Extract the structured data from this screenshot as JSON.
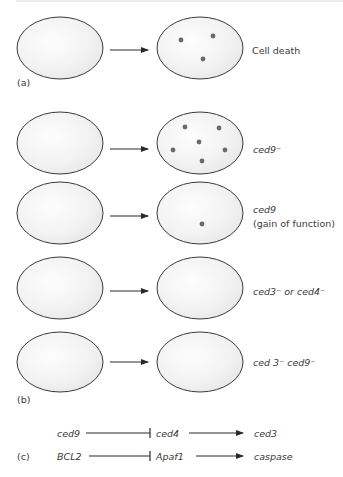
{
  "panels": {
    "a": {
      "label": "(a)",
      "outcome": "Cell death",
      "dots": [
        [
          181,
          40
        ],
        [
          213,
          36
        ],
        [
          203,
          59
        ]
      ]
    },
    "b": {
      "label": "(b)",
      "rows": [
        {
          "label": "ced9⁻",
          "label2": "",
          "dots": [
            [
              185,
              127
            ],
            [
              219,
              128
            ],
            [
              199,
              142
            ],
            [
              173,
              150
            ],
            [
              225,
              150
            ],
            [
              202,
              161
            ]
          ]
        },
        {
          "label": "ced9",
          "label2": "(gain of function)",
          "dots": [
            [
              202,
              224
            ]
          ]
        },
        {
          "label": "ced3⁻ or ced4⁻",
          "label2": "",
          "dots": []
        },
        {
          "label": "ced 3⁻ ced9⁻",
          "label2": "",
          "dots": []
        }
      ]
    },
    "c": {
      "label": "(c)",
      "pathways": [
        {
          "a": "ced9",
          "b": "ced4",
          "c": "ced3"
        },
        {
          "a": "BCL2",
          "b": "Apaf1",
          "c": "caspase"
        }
      ]
    }
  },
  "colors": {
    "outline": "#3a3a3a",
    "dot": "#6a6a6a",
    "fill_light": "#fbfbfb",
    "fill_shade": "#e9e9e9"
  }
}
